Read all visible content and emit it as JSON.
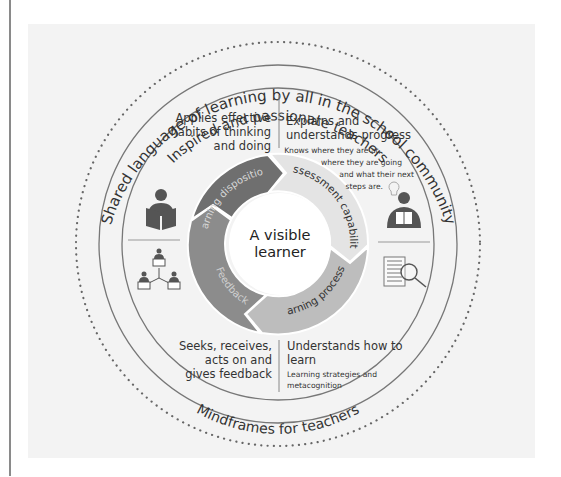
{
  "diagram": {
    "title_lines": [
      "A visible",
      "learner"
    ],
    "outer_ring_label": "Shared language of learning by all in the school community",
    "upper_ring_label": "Inspired and passionate teachers",
    "lower_ring_label": "Mindframes for teachers",
    "quadrants": {
      "top_left": {
        "lines": [
          "Applies effective",
          "habits of thinking",
          "and doing"
        ]
      },
      "top_right": {
        "lines": [
          "Explains and",
          "understands progress"
        ],
        "detail_lines": [
          "Knows where they are at,",
          "where they are going",
          "and what their next",
          "steps are."
        ]
      },
      "bottom_left": {
        "lines": [
          "Seeks, receives,",
          "acts on and",
          "gives feedback"
        ]
      },
      "bottom_right": {
        "lines": [
          "Understands how to",
          "learn"
        ],
        "detail_lines": [
          "Learning strategies and",
          "metacognition"
        ]
      }
    },
    "cycle_segments": [
      {
        "label": "Learning dispositions",
        "color": "#6f6f6f",
        "text_color": "#d8d8d8"
      },
      {
        "label": "Assessment capability",
        "color": "#e4e4e4",
        "text_color": "#333333"
      },
      {
        "label": "Learning processes",
        "color": "#bdbdbd",
        "text_color": "#333333"
      },
      {
        "label": "Feedback",
        "color": "#8c8c8c",
        "text_color": "#cfcfcf"
      }
    ],
    "icons": {
      "top_left": "reading-student-icon",
      "bottom_left": "group-network-icon",
      "top_right": "student-lightbulb-icon",
      "bottom_right": "document-magnifier-icon"
    },
    "colors": {
      "panel": "#f3f3f3",
      "ring_line": "#777777",
      "dots": "#666666",
      "icon": "#555555"
    }
  }
}
